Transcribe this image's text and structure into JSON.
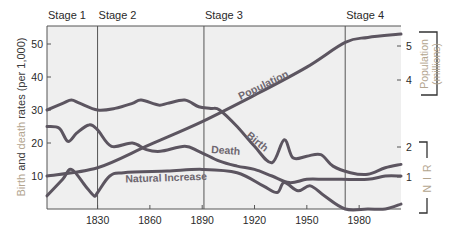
{
  "chart_data": {
    "type": "line",
    "title": "",
    "stages": [
      {
        "label": "Stage 1",
        "start": 1801,
        "end": 1830
      },
      {
        "label": "Stage 2",
        "start": 1830,
        "end": 1891
      },
      {
        "label": "Stage 3",
        "start": 1891,
        "end": 1972
      },
      {
        "label": "Stage 4",
        "start": 1972,
        "end": 2004
      }
    ],
    "x_ticks": [
      1830,
      1860,
      1890,
      1920,
      1950,
      1980
    ],
    "xlim": [
      1801,
      2004
    ],
    "y_left": {
      "label_parts": [
        {
          "text": "Birth",
          "tone": "light"
        },
        {
          "text": " and ",
          "tone": "dark"
        },
        {
          "text": "death",
          "tone": "light"
        },
        {
          "text": " rates (per 1,000)",
          "tone": "dark"
        }
      ],
      "ticks": [
        10,
        20,
        30,
        40,
        50
      ],
      "ylim": [
        0,
        55
      ]
    },
    "y_right_population": {
      "label_line1": "Population",
      "label_line2": "(millions)",
      "ticks": [
        4,
        5
      ]
    },
    "y_right_nir": {
      "label": "N I R",
      "ticks": [
        1,
        2
      ]
    },
    "series": [
      {
        "name": "Birth",
        "axis": "left",
        "x": [
          1801,
          1810,
          1815,
          1820,
          1830,
          1840,
          1850,
          1855,
          1865,
          1870,
          1880,
          1888,
          1895,
          1900,
          1910,
          1920,
          1930,
          1937,
          1942,
          1950,
          1958,
          1965,
          1975,
          1985,
          1995,
          2004
        ],
        "values": [
          30,
          32,
          33,
          32,
          30,
          30.5,
          32,
          33,
          31.5,
          32,
          33,
          31,
          30.5,
          30,
          25,
          19,
          14,
          21,
          15.5,
          16,
          16.5,
          13,
          11,
          10.5,
          12.5,
          13.5
        ]
      },
      {
        "name": "Death",
        "axis": "left",
        "x": [
          1801,
          1808,
          1813,
          1818,
          1825,
          1830,
          1838,
          1850,
          1858,
          1866,
          1880,
          1888,
          1900,
          1910,
          1920,
          1930,
          1940,
          1950,
          1960,
          1970,
          1985,
          1995,
          2004
        ],
        "values": [
          25,
          24.5,
          20.5,
          23,
          25.5,
          24,
          19,
          20,
          18,
          17.5,
          19,
          17.5,
          14.5,
          13,
          12,
          10,
          8,
          9,
          9,
          9,
          9,
          10,
          10
        ]
      },
      {
        "name": "Natural Increase",
        "axis": "left",
        "x": [
          1801,
          1810,
          1815,
          1823,
          1828,
          1830,
          1837,
          1845,
          1870,
          1890,
          1910,
          1925,
          1933,
          1937,
          1945,
          1952,
          1960,
          1972,
          1985,
          1995,
          2004
        ],
        "values": [
          4,
          9,
          12,
          7,
          4,
          5,
          10,
          11,
          11.5,
          12,
          11,
          7,
          5,
          8,
          5.5,
          7,
          4,
          0,
          0,
          0,
          1.5
        ]
      },
      {
        "name": "Population",
        "axis": "right",
        "x": [
          1801,
          1830,
          1860,
          1890,
          1920,
          1950,
          1972,
          1985,
          2004
        ],
        "values": [
          10,
          12.5,
          19.5,
          26.5,
          34.5,
          43,
          50.5,
          52,
          53
        ]
      }
    ],
    "annotations": [
      {
        "text": "Population",
        "x": 1912,
        "y": 33,
        "rotation": -26
      },
      {
        "text": "Birth",
        "x": 1915,
        "y": 22,
        "rotation": 40
      },
      {
        "text": "Death",
        "x": 1895,
        "y": 17,
        "rotation": 4
      },
      {
        "text": "Natural Increase",
        "x": 1846,
        "y": 8,
        "rotation": -2
      }
    ],
    "grid": false,
    "legend": "none (inline labels)"
  }
}
